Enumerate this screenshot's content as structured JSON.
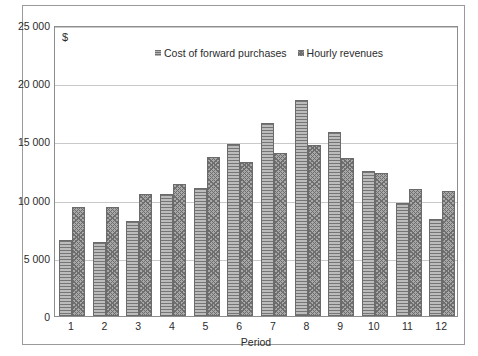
{
  "chart_data": {
    "type": "bar",
    "title": "",
    "subtitle": "",
    "xlabel": "Period",
    "ylabel": "$",
    "currency_symbol": "$",
    "categories": [
      "1",
      "2",
      "3",
      "4",
      "5",
      "6",
      "7",
      "8",
      "9",
      "10",
      "11",
      "12"
    ],
    "series": [
      {
        "name": "Cost of forward purchases",
        "pattern": "horizontal-lines",
        "color": "#9a9a9a",
        "values": [
          6500,
          6400,
          8200,
          10500,
          11000,
          14800,
          16600,
          18600,
          15800,
          12500,
          9700,
          8300
        ]
      },
      {
        "name": "Hourly revenues",
        "pattern": "crosshatch-dots",
        "color": "#a8a8a8",
        "values": [
          9400,
          9400,
          10500,
          11300,
          13700,
          13200,
          14000,
          14700,
          13600,
          12300,
          10900,
          10700
        ]
      }
    ],
    "ylim": [
      0,
      25000
    ],
    "yticks": [
      0,
      5000,
      10000,
      15000,
      20000,
      25000
    ],
    "ytick_labels": [
      "0",
      "5 000",
      "10 000",
      "15 000",
      "20 000",
      "25 000"
    ],
    "grid": true,
    "legend_position": "top-center",
    "legend": [
      "Cost of forward purchases",
      "Hourly revenues"
    ]
  }
}
